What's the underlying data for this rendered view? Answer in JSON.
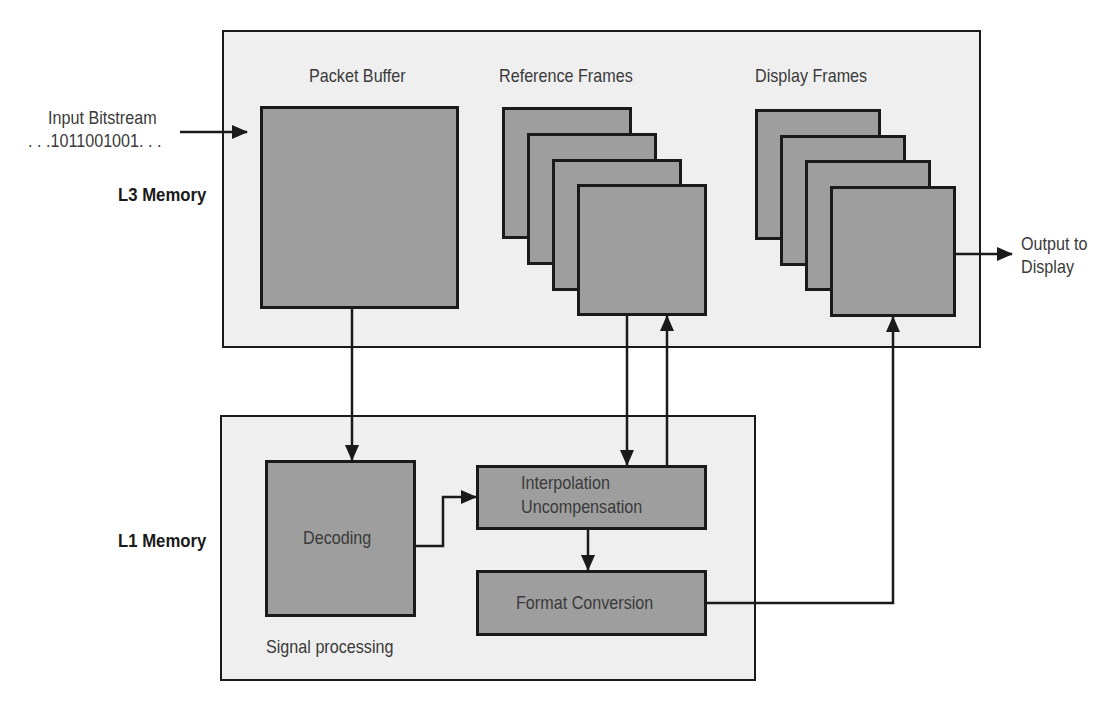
{
  "diagram": {
    "type": "video-decoder-memory-architecture",
    "external": {
      "input_label_line1": "Input Bitstream",
      "input_label_line2": ". . .1011001001. . .",
      "output_label_line1": "Output to",
      "output_label_line2": "Display"
    },
    "regions": {
      "l3": {
        "label": "L3 Memory",
        "sections": {
          "packet_buffer": "Packet Buffer",
          "reference_frames": "Reference Frames",
          "display_frames": "Display Frames"
        },
        "reference_frame_count": 4,
        "display_frame_count": 4
      },
      "l1": {
        "label": "L1 Memory",
        "caption": "Signal processing",
        "blocks": {
          "decoding": "Decoding",
          "interpolation_line1": "Interpolation",
          "interpolation_line2": "Uncompensation",
          "format_conversion": "Format Conversion"
        }
      }
    },
    "edges": [
      {
        "from": "Input Bitstream",
        "to": "Packet Buffer"
      },
      {
        "from": "Packet Buffer",
        "to": "Decoding"
      },
      {
        "from": "Decoding",
        "to": "Interpolation Uncompensation"
      },
      {
        "from": "Reference Frames",
        "to": "Interpolation Uncompensation"
      },
      {
        "from": "Interpolation Uncompensation",
        "to": "Reference Frames"
      },
      {
        "from": "Interpolation Uncompensation",
        "to": "Format Conversion"
      },
      {
        "from": "Format Conversion",
        "to": "Display Frames"
      },
      {
        "from": "Display Frames",
        "to": "Output to Display"
      }
    ],
    "colors": {
      "region_fill": "#efefef",
      "block_fill": "#9e9e9e",
      "stroke": "#1a1a1a",
      "background": "#ffffff"
    }
  }
}
